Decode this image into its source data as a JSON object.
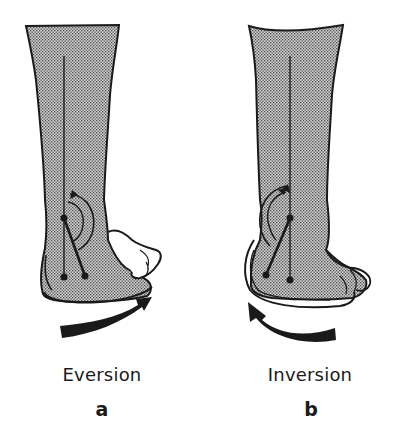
{
  "figure": {
    "type": "anatomical-diagram",
    "colors": {
      "ink": "#1a1a1a",
      "shading_dot": "#555555",
      "shading_bg": "#c8c8c8",
      "background": "#ffffff"
    },
    "panels": [
      {
        "id": "a",
        "motion_label": "Eversion",
        "panel_letter": "a",
        "arrow_direction": "clockwise (left-to-right, sweeping upward to the right)"
      },
      {
        "id": "b",
        "motion_label": "Inversion",
        "panel_letter": "b",
        "arrow_direction": "counter-clockwise (right-to-left, sweeping upward to the left)"
      }
    ]
  }
}
